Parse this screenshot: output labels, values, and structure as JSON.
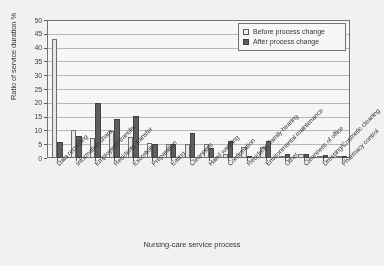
{
  "chart_data": {
    "type": "bar",
    "title": "",
    "xlabel": "Nursing-care service process",
    "ylabel": "Ratio of service duration  %",
    "ylim": [
      0,
      50
    ],
    "ytick_step": 5,
    "yticks": [
      "0",
      "5",
      "10",
      "15",
      "20",
      "25",
      "30",
      "35",
      "40",
      "45",
      "50"
    ],
    "grid": true,
    "legend_position": "top-right",
    "categories": [
      "Data recording",
      "Information share",
      "Employees' transfer",
      "Residents' transfer",
      "Excretion",
      "Preparation",
      "Eating",
      "Cleanness",
      "Hand washing",
      "Confirmation",
      "Residents' family hearing",
      "Environmental maintenance",
      "Other",
      "Cleanness of office",
      "Dressing/Cosmetic cleaning",
      "Pharmacy control"
    ],
    "series": [
      {
        "name": "Before process change",
        "color": "#eceae6",
        "values": [
          43.3,
          10.3,
          7.2,
          9.8,
          7.5,
          5.3,
          5.2,
          5.1,
          5.0,
          1.3,
          4.0,
          3.9,
          0.9,
          1.4,
          0.7,
          0.5
        ]
      },
      {
        "name": "After process change",
        "color": "#5a5a5a",
        "values": [
          5.7,
          8.0,
          20.1,
          14.2,
          15.4,
          5.1,
          4.9,
          9.2,
          3.6,
          6.2,
          0.9,
          6.0,
          1.5,
          1.3,
          1.0,
          0.4
        ]
      }
    ]
  },
  "legend": {
    "items": [
      {
        "label": "Before process change"
      },
      {
        "label": "After process change"
      }
    ]
  }
}
